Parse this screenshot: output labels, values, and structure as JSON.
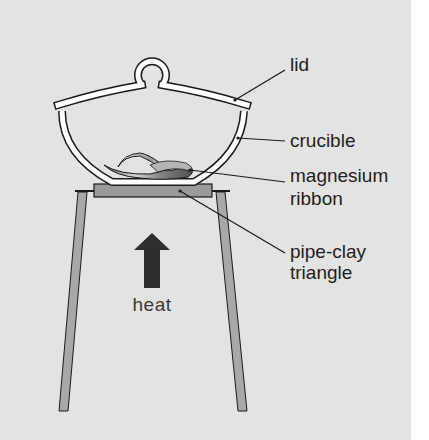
{
  "diagram": {
    "colors": {
      "panel": "#e3e3e3",
      "page": "#ffffff",
      "outline": "#1a1a1a",
      "glass": "#ffffff",
      "triangle_block": "#9a9a9a",
      "legs": "#a8a8a8",
      "arrow": "#2e2e2e",
      "ribbon_light": "#d8d8d8",
      "ribbon_dark": "#6a6a6a"
    },
    "labels": {
      "lid": "lid",
      "crucible": "crucible",
      "magnesium_line1": "magnesium",
      "magnesium_line2": "ribbon",
      "triangle_line1": "pipe-clay",
      "triangle_line2": "triangle",
      "heat": "heat"
    },
    "components": [
      {
        "name": "lid",
        "pointer_from": [
          235,
          100
        ],
        "pointer_to": [
          285,
          70
        ]
      },
      {
        "name": "crucible",
        "pointer_from": [
          238,
          138
        ],
        "pointer_to": [
          285,
          141
        ]
      },
      {
        "name": "magnesium ribbon",
        "pointer_from": [
          190,
          170
        ],
        "pointer_to": [
          285,
          182
        ]
      },
      {
        "name": "pipe-clay triangle",
        "pointer_from": [
          180,
          191
        ],
        "pointer_to": [
          285,
          253
        ]
      },
      {
        "name": "heat arrow",
        "direction": "up"
      }
    ]
  }
}
